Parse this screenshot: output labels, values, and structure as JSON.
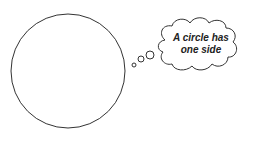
{
  "diagram": {
    "shapes": {
      "circle": {
        "cx": 68,
        "cy": 71,
        "r": 57,
        "stroke": "#333333"
      },
      "bubbles": [
        {
          "cx": 134,
          "cy": 65,
          "r": 2
        },
        {
          "cx": 141,
          "cy": 59,
          "r": 3
        },
        {
          "cx": 150,
          "cy": 55,
          "r": 4
        }
      ]
    },
    "thought": {
      "line1": "A circle has",
      "line2": "one side"
    }
  }
}
